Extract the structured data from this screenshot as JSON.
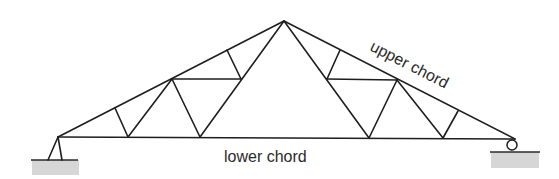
{
  "diagram": {
    "type": "roof truss",
    "labels": {
      "upper": "upper chord",
      "lower": "lower chord"
    },
    "supports": {
      "left": "pinned",
      "right": "roller"
    },
    "colors": {
      "line": "#1e1e1e",
      "ground_fill": "#d6d6d6",
      "text": "#2a2a2a"
    }
  }
}
